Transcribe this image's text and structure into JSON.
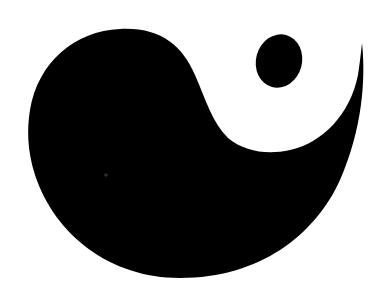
{
  "image": {
    "subject": "stylized yin-yang teardrop symbol",
    "background_color": "#ffffff",
    "shape_color": "#000000",
    "elements": [
      {
        "name": "black-teardrop",
        "description": "large black comma-shaped blob with tail curling up to the right"
      },
      {
        "name": "black-dot",
        "description": "small black oval inside the white region, upper right"
      }
    ]
  }
}
